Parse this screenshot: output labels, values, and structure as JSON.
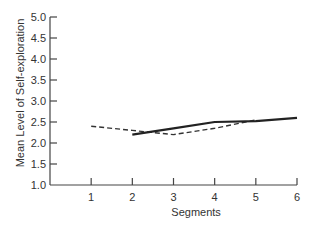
{
  "chart_data": {
    "type": "line",
    "title": "",
    "xlabel": "Segments",
    "ylabel": "Mean Level of Self-exploration",
    "x_ticks": [
      "1",
      "2",
      "3",
      "4",
      "5",
      "6"
    ],
    "y_ticks": [
      "1.0",
      "1.5",
      "2.0",
      "2.5",
      "3.0",
      "3.5",
      "4.0",
      "4.5",
      "5.0"
    ],
    "xlim": [
      0,
      6
    ],
    "ylim": [
      1.0,
      5.0
    ],
    "grid": false,
    "legend": null,
    "series": [
      {
        "name": "dashed",
        "style": "dashed",
        "color": "#333333",
        "x": [
          1,
          2,
          3,
          4,
          5
        ],
        "y": [
          2.4,
          2.3,
          2.2,
          2.35,
          2.55
        ]
      },
      {
        "name": "solid",
        "style": "solid",
        "color": "#222222",
        "x": [
          2,
          3,
          4,
          5,
          6
        ],
        "y": [
          2.2,
          2.35,
          2.5,
          2.52,
          2.6
        ]
      }
    ]
  }
}
